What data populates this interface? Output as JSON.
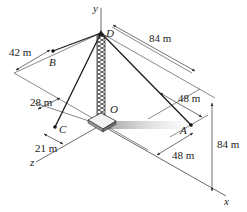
{
  "figure": {
    "type": "3D statics diagram - guyed tower",
    "axes": {
      "x": "x",
      "y": "y",
      "z": "z"
    },
    "points": {
      "D": "D",
      "O": "O",
      "A": "A",
      "B": "B",
      "C": "C"
    },
    "dimensions": {
      "B_offset": "42 m",
      "D_to_edge": "84 m",
      "A_offset_top": "48 m",
      "C_offset_top": "28 m",
      "C_offset_bottom": "21 m",
      "A_offset_bottom": "48 m",
      "tower_height": "84 m"
    },
    "colors": {
      "line": "#333333",
      "cable": "#1a1a1a",
      "shadow": "#b8b8b8"
    }
  }
}
